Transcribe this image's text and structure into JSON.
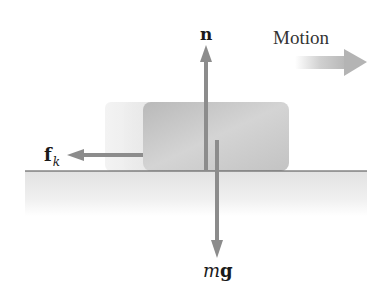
{
  "diagram": {
    "labels": {
      "normal_force": "n",
      "motion": "Motion",
      "friction_main": "f",
      "friction_sub": "k",
      "weight_m": "m",
      "weight_g": "g"
    },
    "forces": [
      {
        "name": "normal force",
        "symbol": "n",
        "direction": "up"
      },
      {
        "name": "kinetic friction",
        "symbol": "f_k",
        "direction": "left"
      },
      {
        "name": "weight",
        "symbol": "mg",
        "direction": "down"
      }
    ],
    "motion_direction": "right",
    "colors": {
      "arrow": "#8c8c8c",
      "block": "#c8c8c8",
      "ground_line": "#4a4a4a",
      "ground_fill": "#e6e6e6",
      "text": "#1a1a1a"
    }
  }
}
